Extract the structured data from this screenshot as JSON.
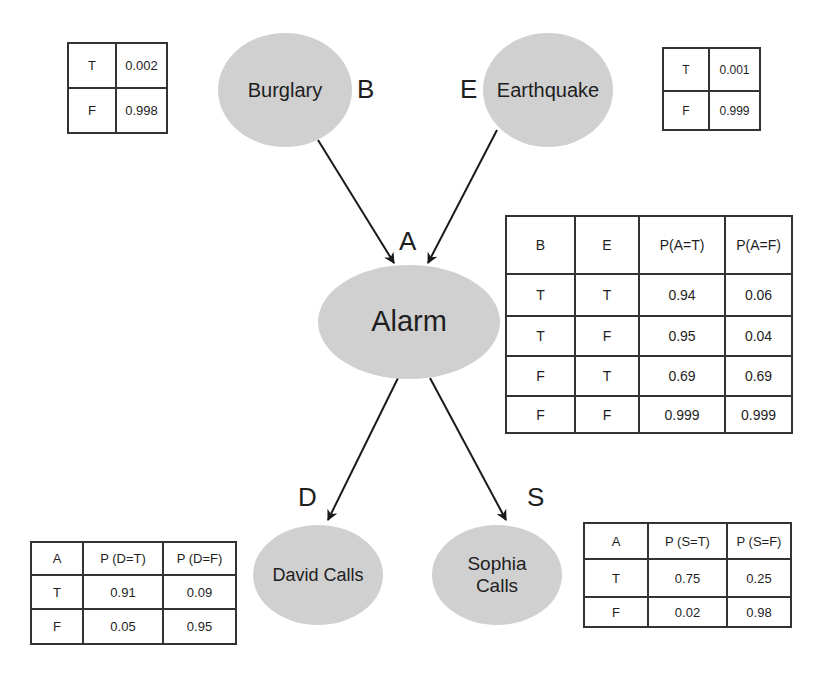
{
  "diagram": {
    "type": "bayesian-network",
    "colors": {
      "node_fill": "#d0d0d0",
      "edge": "#1a1a1a",
      "border": "#333333"
    },
    "nodes": {
      "burglary": {
        "name": "Burglary",
        "symbol": "B"
      },
      "earthquake": {
        "name": "Earthquake",
        "symbol": "E"
      },
      "alarm": {
        "name": "Alarm",
        "symbol": "A"
      },
      "david": {
        "name": "David Calls",
        "symbol": "D"
      },
      "sophia": {
        "name_line1": "Sophia",
        "name_line2": "Calls",
        "symbol": "S"
      }
    },
    "edges": [
      {
        "from": "Burglary",
        "to": "Alarm"
      },
      {
        "from": "Earthquake",
        "to": "Alarm"
      },
      {
        "from": "Alarm",
        "to": "David Calls"
      },
      {
        "from": "Alarm",
        "to": "Sophia Calls"
      }
    ]
  },
  "tables": {
    "burglary": {
      "rows": [
        {
          "value": "T",
          "p": "0.002"
        },
        {
          "value": "F",
          "p": "0.998"
        }
      ]
    },
    "earthquake": {
      "rows": [
        {
          "value": "T",
          "p": "0.001"
        },
        {
          "value": "F",
          "p": "0.999"
        }
      ]
    },
    "alarm": {
      "headers": [
        "B",
        "E",
        "P(A=T)",
        "P(A=F)"
      ],
      "rows": [
        [
          "T",
          "T",
          "0.94",
          "0.06"
        ],
        [
          "T",
          "F",
          "0.95",
          "0.04"
        ],
        [
          "F",
          "T",
          "0.69",
          "0.69"
        ],
        [
          "F",
          "F",
          "0.999",
          "0.999"
        ]
      ]
    },
    "david": {
      "headers": [
        "A",
        "P (D=T)",
        "P (D=F)"
      ],
      "rows": [
        [
          "T",
          "0.91",
          "0.09"
        ],
        [
          "F",
          "0.05",
          "0.95"
        ]
      ]
    },
    "sophia": {
      "headers": [
        "A",
        "P (S=T)",
        "P (S=F)"
      ],
      "rows": [
        [
          "T",
          "0.75",
          "0.25"
        ],
        [
          "F",
          "0.02",
          "0.98"
        ]
      ]
    }
  }
}
